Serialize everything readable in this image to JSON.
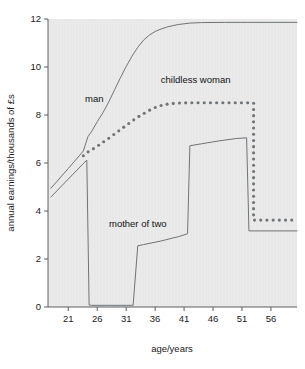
{
  "chart_data": {
    "type": "line",
    "title": "",
    "xlabel": "age/years",
    "ylabel": "annual earnings/thousands of £s",
    "xlim": [
      17.5,
      60.5
    ],
    "ylim": [
      0,
      12
    ],
    "xticks": [
      21,
      26,
      31,
      36,
      41,
      46,
      51,
      56
    ],
    "yticks": [
      0,
      2,
      4,
      6,
      8,
      10,
      12
    ],
    "grid": false,
    "legend_position": "inline-annotations",
    "background_color": "#ebebeb",
    "line_color": "#6f7478",
    "axis_color": "#5a5f63",
    "series": [
      {
        "name": "man",
        "style": "solid",
        "label": "man",
        "label_x": 25.5,
        "label_y": 8.55,
        "points": [
          [
            18.0,
            4.95
          ],
          [
            19.0,
            5.22
          ],
          [
            20.0,
            5.5
          ],
          [
            21.0,
            5.77
          ],
          [
            22.0,
            6.05
          ],
          [
            23.0,
            6.33
          ],
          [
            23.6,
            6.5
          ],
          [
            24.4,
            7.1
          ],
          [
            25.0,
            7.3
          ],
          [
            26.0,
            7.72
          ],
          [
            27.0,
            8.1
          ],
          [
            28.0,
            8.55
          ],
          [
            29.0,
            9.05
          ],
          [
            30.0,
            9.55
          ],
          [
            31.0,
            10.02
          ],
          [
            32.0,
            10.45
          ],
          [
            33.0,
            10.82
          ],
          [
            34.0,
            11.12
          ],
          [
            35.0,
            11.33
          ],
          [
            36.0,
            11.48
          ],
          [
            37.0,
            11.58
          ],
          [
            38.0,
            11.66
          ],
          [
            39.0,
            11.72
          ],
          [
            40.0,
            11.77
          ],
          [
            41.0,
            11.8
          ],
          [
            42.0,
            11.83
          ],
          [
            44.0,
            11.85
          ],
          [
            48.0,
            11.86
          ],
          [
            52.0,
            11.86
          ],
          [
            56.0,
            11.86
          ],
          [
            60.5,
            11.86
          ]
        ]
      },
      {
        "name": "childless woman",
        "style": "dotted",
        "label": "childless woman",
        "label_x": 43.0,
        "label_y": 9.35,
        "points": [
          [
            23.6,
            6.3
          ],
          [
            24.5,
            6.48
          ],
          [
            25.5,
            6.62
          ],
          [
            26.5,
            6.78
          ],
          [
            27.5,
            6.95
          ],
          [
            28.5,
            7.12
          ],
          [
            29.5,
            7.3
          ],
          [
            30.5,
            7.48
          ],
          [
            31.5,
            7.66
          ],
          [
            32.5,
            7.83
          ],
          [
            33.5,
            7.99
          ],
          [
            34.5,
            8.13
          ],
          [
            35.5,
            8.26
          ],
          [
            36.5,
            8.36
          ],
          [
            37.5,
            8.43
          ],
          [
            38.5,
            8.47
          ],
          [
            40.0,
            8.5
          ],
          [
            42.0,
            8.51
          ],
          [
            44.0,
            8.51
          ],
          [
            46.0,
            8.51
          ],
          [
            48.0,
            8.51
          ],
          [
            50.0,
            8.51
          ],
          [
            52.0,
            8.51
          ],
          [
            53.0,
            8.5
          ],
          [
            53.0,
            3.62
          ],
          [
            54.5,
            3.62
          ],
          [
            56.0,
            3.62
          ],
          [
            57.5,
            3.62
          ],
          [
            59.0,
            3.62
          ],
          [
            60.5,
            3.62
          ]
        ]
      },
      {
        "name": "mother of two",
        "style": "solid",
        "label": "mother of two",
        "label_x": 33.0,
        "label_y": 3.35,
        "points": [
          [
            18.0,
            4.58
          ],
          [
            20.0,
            5.08
          ],
          [
            22.0,
            5.58
          ],
          [
            23.5,
            5.95
          ],
          [
            24.2,
            6.12
          ],
          [
            24.6,
            0.08
          ],
          [
            25.0,
            0.07
          ],
          [
            28.0,
            0.07
          ],
          [
            31.0,
            0.07
          ],
          [
            32.2,
            0.07
          ],
          [
            33.0,
            2.55
          ],
          [
            34.0,
            2.6
          ],
          [
            37.0,
            2.75
          ],
          [
            40.0,
            2.93
          ],
          [
            41.6,
            3.05
          ],
          [
            42.0,
            6.72
          ],
          [
            44.0,
            6.8
          ],
          [
            47.0,
            6.92
          ],
          [
            50.0,
            7.02
          ],
          [
            51.8,
            7.05
          ],
          [
            52.2,
            3.17
          ],
          [
            54.0,
            3.17
          ],
          [
            57.0,
            3.17
          ],
          [
            60.5,
            3.17
          ]
        ]
      }
    ]
  },
  "figure": {
    "caption": ""
  }
}
